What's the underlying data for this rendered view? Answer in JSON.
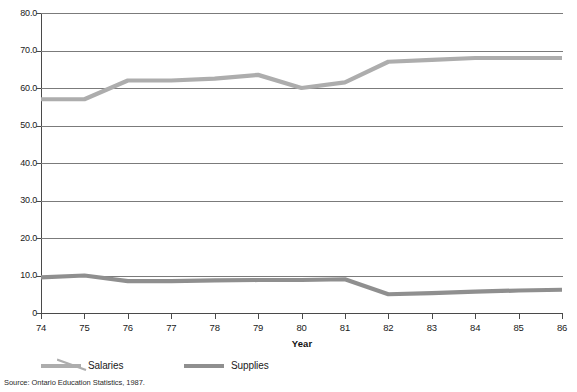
{
  "chart_data": {
    "type": "line",
    "title": "",
    "xlabel": "Year",
    "ylabel": "",
    "categories": [
      "74",
      "75",
      "76",
      "77",
      "78",
      "79",
      "80",
      "81",
      "82",
      "83",
      "84",
      "85",
      "86"
    ],
    "series": [
      {
        "name": "Salaries",
        "color": "#adadad",
        "values": [
          57.0,
          57.0,
          62.0,
          62.0,
          62.5,
          63.5,
          60.0,
          61.5,
          67.0,
          67.5,
          68.0,
          68.0,
          68.0
        ]
      },
      {
        "name": "Supplies",
        "color": "#8f8f8f",
        "values": [
          9.5,
          10.0,
          8.5,
          8.5,
          8.7,
          8.8,
          8.8,
          9.0,
          5.0,
          5.3,
          5.7,
          6.0,
          6.2
        ]
      }
    ],
    "ylim": [
      0,
      80
    ],
    "xlim": [
      "74",
      "86"
    ],
    "ytick_labels": [
      "80.0",
      "70.0",
      "60.0",
      "50.0",
      "40.0",
      "30.0",
      "20.0",
      "10.0",
      "0"
    ],
    "ytick_values": [
      80,
      70,
      60,
      50,
      40,
      30,
      20,
      10,
      0
    ],
    "grid": true,
    "grid_axis": "y",
    "legend_position": "bottom-left"
  },
  "legend": {
    "entries": [
      {
        "label": "Salaries"
      },
      {
        "label": "Supplies"
      }
    ]
  },
  "axis": {
    "x_title": "Year"
  },
  "footer": {
    "source": "Source:  Ontario Education Statistics, 1987."
  },
  "colors": {
    "salaries": "#adadad",
    "supplies": "#8f8f8f",
    "grid": "#7b7b7b",
    "axis": "#4a4a4a",
    "text": "#1a1a1a",
    "background": "#ffffff"
  }
}
